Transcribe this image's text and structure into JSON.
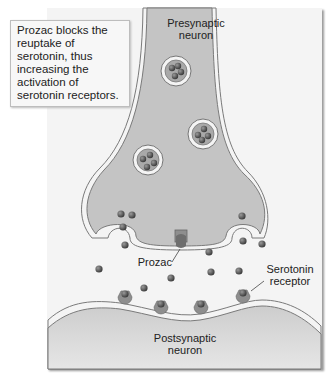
{
  "callout": {
    "text": "Prozac blocks the reuptake of serotonin, thus increasing the activation of serotonin receptors."
  },
  "labels": {
    "presynaptic_line1": "Presynaptic",
    "presynaptic_line2": "neuron",
    "prozac": "Prozac",
    "receptor_line1": "Serotonin",
    "receptor_line2": "receptor",
    "postsynaptic_line1": "Postsynaptic",
    "postsynaptic_line2": "neuron"
  },
  "colors": {
    "panel_bg": "#f4f4f4",
    "neuron_fill": "#c4c4c4",
    "membrane": "#777777",
    "serotonin": "#555555",
    "receptor": "#8e8e8e"
  }
}
